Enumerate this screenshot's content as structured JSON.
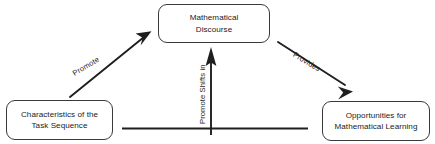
{
  "diagram": {
    "background_color": "#ffffff",
    "stroke_color": "#1f1f1f",
    "text_color": "#222222",
    "nodes": [
      {
        "id": "mathematical-discourse",
        "label": "Mathematical\nDiscourse",
        "shape": "rounded-rectangle",
        "position": "top-center"
      },
      {
        "id": "characteristics-task-sequence",
        "label": "Characteristics of the\nTask Sequence",
        "shape": "rounded-rectangle",
        "position": "bottom-left"
      },
      {
        "id": "opportunities-mathematical-learning",
        "label": "Opportunities for\nMathematical Learning",
        "shape": "rounded-rectangle",
        "position": "bottom-right"
      }
    ],
    "edges": [
      {
        "id": "promote",
        "label": "Promote",
        "from": "characteristics-task-sequence",
        "to": "mathematical-discourse",
        "direction": "up-right",
        "label_rotation_deg": -31
      },
      {
        "id": "provides",
        "label": "Provides",
        "from": "mathematical-discourse",
        "to": "opportunities-mathematical-learning",
        "direction": "down-right",
        "label_rotation_deg": 31
      },
      {
        "id": "promote-shifts-in",
        "label": "Promote Shifts in",
        "from": "baseline",
        "to": "mathematical-discourse",
        "direction": "up",
        "label_rotation_deg": -90
      }
    ],
    "baseline": {
      "id": "horizontal-baseline",
      "description": "horizontal rule beneath the center"
    }
  }
}
